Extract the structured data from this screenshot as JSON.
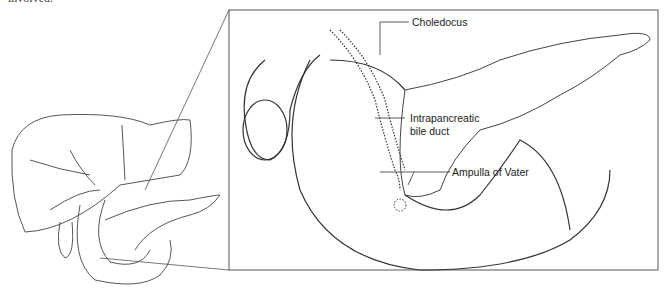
{
  "caption_fragment": "involved.",
  "labels": {
    "choledocus": "Choledocus",
    "intrapancreatic_line1": "Intrapancreatic",
    "intrapancreatic_line2": "bile duct",
    "ampulla": "Ampulla of Vater"
  },
  "colors": {
    "line": "#333333",
    "box": "#555555"
  }
}
